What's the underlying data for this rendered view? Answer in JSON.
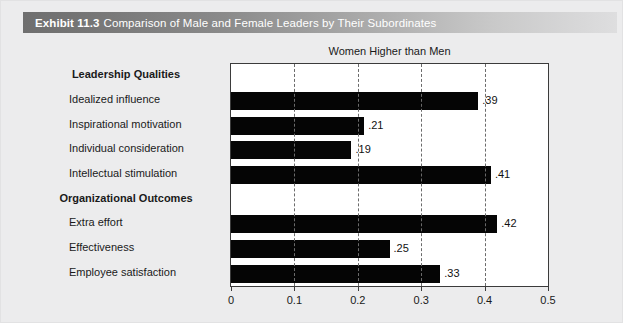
{
  "header": {
    "exhibit_number": "Exhibit 11.3",
    "exhibit_title": "Comparison of Male and Female Leaders by Their Subordinates"
  },
  "chart_data": {
    "type": "bar",
    "orientation": "horizontal",
    "title": "Women Higher than Men",
    "xlabel": "",
    "ylabel": "",
    "xlim": [
      0,
      0.5
    ],
    "xticks": [
      0,
      0.1,
      0.2,
      0.3,
      0.4,
      0.5
    ],
    "xtick_labels": [
      "0",
      "0.1",
      "0.2",
      "0.3",
      "0.4",
      "0.5"
    ],
    "grid": "vertical-dashed",
    "legend": "none",
    "bar_color": "#050505",
    "groups": [
      {
        "name": "Leadership Qualities",
        "categories": [
          "Idealized influence",
          "Inspirational motivation",
          "Individual consideration",
          "Intellectual stimulation"
        ],
        "values": [
          0.39,
          0.21,
          0.19,
          0.41
        ],
        "value_labels": [
          ".39",
          ".21",
          ".19",
          ".41"
        ]
      },
      {
        "name": "Organizational Outcomes",
        "categories": [
          "Extra effort",
          "Effectiveness",
          "Employee satisfaction"
        ],
        "values": [
          0.42,
          0.25,
          0.33
        ],
        "value_labels": [
          ".42",
          ".25",
          ".33"
        ]
      }
    ],
    "categories": [
      "Idealized influence",
      "Inspirational motivation",
      "Individual consideration",
      "Intellectual stimulation",
      "Extra effort",
      "Effectiveness",
      "Employee satisfaction"
    ],
    "values": [
      0.39,
      0.21,
      0.19,
      0.41,
      0.42,
      0.25,
      0.33
    ]
  },
  "rows": [
    {
      "kind": "group",
      "label": "Leadership Qualities"
    },
    {
      "kind": "bar",
      "label": "Idealized influence",
      "value": 0.39,
      "value_label": ".39"
    },
    {
      "kind": "bar",
      "label": "Inspirational motivation",
      "value": 0.21,
      "value_label": ".21"
    },
    {
      "kind": "bar",
      "label": "Individual consideration",
      "value": 0.19,
      "value_label": ".19"
    },
    {
      "kind": "bar",
      "label": "Intellectual stimulation",
      "value": 0.41,
      "value_label": ".41"
    },
    {
      "kind": "group",
      "label": "Organizational Outcomes"
    },
    {
      "kind": "bar",
      "label": "Extra effort",
      "value": 0.42,
      "value_label": ".42"
    },
    {
      "kind": "bar",
      "label": "Effectiveness",
      "value": 0.25,
      "value_label": ".25"
    },
    {
      "kind": "bar",
      "label": "Employee satisfaction",
      "value": 0.33,
      "value_label": ".33"
    }
  ]
}
